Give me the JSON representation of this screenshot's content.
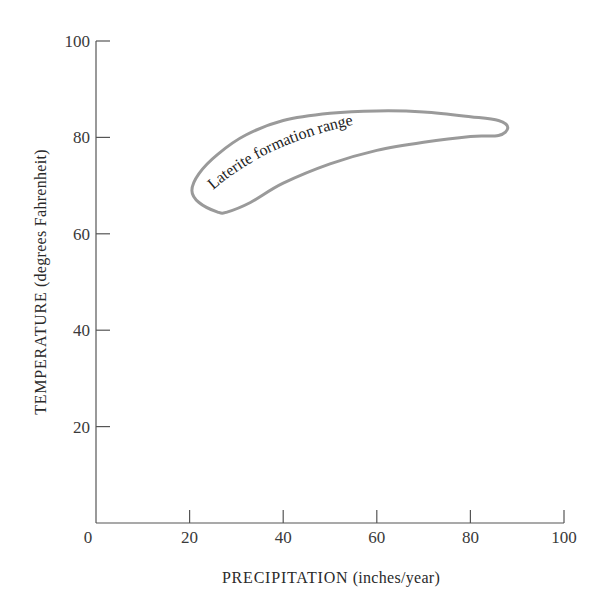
{
  "chart_data": {
    "type": "area",
    "title": "",
    "xlabel": "PRECIPITATION (inches/year)",
    "xlabel_main": "PRECIPITATION",
    "xlabel_unit": "(inches/year)",
    "ylabel": "TEMPERATURE (degrees Fahrenheit)",
    "ylabel_main": "TEMPERATURE",
    "ylabel_unit": "(degrees Fahrenheit)",
    "xlim": [
      0,
      100
    ],
    "ylim": [
      0,
      100
    ],
    "x_ticks": [
      0,
      20,
      40,
      60,
      80,
      100
    ],
    "y_ticks": [
      20,
      40,
      60,
      80,
      100
    ],
    "origin_label": "0",
    "grid": false,
    "legend": null,
    "regions": [
      {
        "name": "Laterite formation range",
        "label": "Laterite formation range",
        "stroke_color": "#9a9a9a",
        "outline_points": [
          [
            26,
            64.5
          ],
          [
            22,
            66.5
          ],
          [
            20.5,
            69
          ],
          [
            22,
            72.5
          ],
          [
            26,
            76.5
          ],
          [
            32,
            80.5
          ],
          [
            40,
            83.5
          ],
          [
            50,
            85
          ],
          [
            60,
            85.5
          ],
          [
            70,
            85.3
          ],
          [
            80,
            84.3
          ],
          [
            86,
            83.5
          ],
          [
            88,
            82
          ],
          [
            86,
            80.4
          ],
          [
            80,
            80.2
          ],
          [
            70,
            79
          ],
          [
            60,
            77.3
          ],
          [
            50,
            74.5
          ],
          [
            40,
            70.5
          ],
          [
            33,
            66.5
          ],
          [
            28,
            64.5
          ]
        ]
      }
    ]
  }
}
